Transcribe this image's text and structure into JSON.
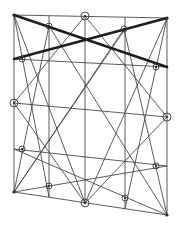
{
  "diagram": {
    "type": "geometric-construction",
    "colors": {
      "line": "#4a4a4a",
      "thick_line": "#1e1e1e",
      "background": "#ffffff"
    },
    "frame": {
      "top_left": [
        14,
        15
      ],
      "top_right": [
        167,
        18
      ],
      "bottom_right": [
        167,
        215
      ],
      "bottom_left": [
        14,
        192
      ]
    },
    "verticals": [
      {
        "x": 49,
        "y1": 16,
        "y2": 197
      },
      {
        "x": 85,
        "y1": 16,
        "y2": 204
      },
      {
        "x": 125,
        "y1": 17,
        "y2": 209
      }
    ],
    "thin_lines": [
      [
        14,
        15,
        49,
        197
      ],
      [
        14,
        15,
        85,
        203
      ],
      [
        167,
        18,
        125,
        209
      ],
      [
        167,
        18,
        85,
        203
      ],
      [
        85,
        16,
        14,
        103
      ],
      [
        85,
        16,
        167,
        117
      ],
      [
        14,
        103,
        85,
        203
      ],
      [
        167,
        117,
        85,
        203
      ],
      [
        14,
        59,
        167,
        67
      ],
      [
        14,
        103,
        167,
        117
      ],
      [
        14,
        149,
        167,
        166
      ],
      [
        14,
        192,
        167,
        166
      ],
      [
        14,
        149,
        167,
        215
      ],
      [
        14,
        192,
        125,
        29
      ],
      [
        49,
        26,
        14,
        192
      ],
      [
        49,
        26,
        167,
        215
      ],
      [
        124,
        29,
        14,
        192
      ],
      [
        124,
        29,
        167,
        215
      ]
    ],
    "thick_lines": [
      [
        14,
        15,
        167,
        67
      ],
      [
        14,
        59,
        167,
        18
      ]
    ],
    "circled_nodes": [
      {
        "x": 85,
        "y": 16,
        "r": 4
      },
      {
        "x": 49,
        "y": 26,
        "r": 3
      },
      {
        "x": 124,
        "y": 29,
        "r": 3
      },
      {
        "x": 22,
        "y": 59,
        "r": 3
      },
      {
        "x": 156,
        "y": 67,
        "r": 3
      },
      {
        "x": 14,
        "y": 103,
        "r": 4
      },
      {
        "x": 167,
        "y": 117,
        "r": 4
      },
      {
        "x": 22,
        "y": 149,
        "r": 3
      },
      {
        "x": 156,
        "y": 166,
        "r": 3
      },
      {
        "x": 49,
        "y": 186,
        "r": 3
      },
      {
        "x": 125,
        "y": 198,
        "r": 3
      },
      {
        "x": 85,
        "y": 203,
        "r": 4
      }
    ],
    "corner_dots": [
      {
        "x": 14,
        "y": 15
      },
      {
        "x": 167,
        "y": 18
      },
      {
        "x": 14,
        "y": 192
      },
      {
        "x": 167,
        "y": 215
      }
    ]
  }
}
